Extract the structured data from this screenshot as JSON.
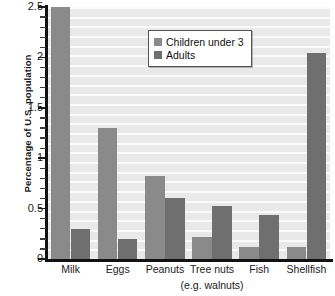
{
  "chart_data": {
    "type": "bar",
    "title": "",
    "xlabel": "",
    "ylabel": "Percentage of U.S. population",
    "ylim": [
      0,
      2.5
    ],
    "ytick_labels": [
      "0",
      "0.5",
      "1",
      "1.5",
      "2",
      "2.5"
    ],
    "ytick_values": [
      0,
      0.5,
      1,
      1.5,
      2,
      2.5
    ],
    "minor_ticks_per_interval": 4,
    "grid": true,
    "grid_orientation": "horizontal",
    "legend_position": "upper center",
    "categories": [
      "Milk",
      "Eggs",
      "Peanuts",
      "Tree nuts",
      "Fish",
      "Shellfish"
    ],
    "category_sublabels": [
      "",
      "",
      "",
      "(e.g. walnuts)",
      "",
      ""
    ],
    "series": [
      {
        "name": "Children under 3",
        "color": "#8a8a8a",
        "values": [
          2.5,
          1.3,
          0.82,
          0.22,
          0.12,
          0.12
        ]
      },
      {
        "name": "Adults",
        "color": "#6f6f6f",
        "values": [
          0.3,
          0.2,
          0.61,
          0.53,
          0.44,
          2.04
        ]
      }
    ]
  },
  "legend": {
    "items": [
      {
        "label": "Children under 3",
        "swatch_color": "#8a8a8a"
      },
      {
        "label": "Adults",
        "swatch_color": "#6f6f6f"
      }
    ]
  },
  "axes": {
    "y_title": "Percentage of U.S. population",
    "y_labels": [
      "2.5",
      "2",
      "1.5",
      "1",
      "0.5",
      "0"
    ],
    "x_labels": [
      "Milk",
      "Eggs",
      "Peanuts",
      "Tree nuts",
      "Fish",
      "Shellfish"
    ],
    "x_sublabel": "(e.g. walnuts)"
  },
  "colors": {
    "plot_background": "#e9e9e9",
    "gridline": "#fbfbfb",
    "axis": "#111111",
    "children_bar": "#8a8a8a",
    "adults_bar": "#6f6f6f",
    "text": "#1a1a1a"
  }
}
